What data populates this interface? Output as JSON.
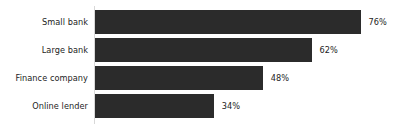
{
  "chart_data": {
    "type": "bar",
    "orientation": "horizontal",
    "title": "",
    "subtitle": "",
    "xlabel": "",
    "ylabel": "",
    "categories": [
      "Small bank",
      "Large bank",
      "Finance company",
      "Online lender"
    ],
    "values": [
      76,
      62,
      48,
      34
    ],
    "value_labels": [
      "76%",
      "62%",
      "48%",
      "34%"
    ],
    "unit": "%",
    "xlim": [
      0,
      87
    ],
    "grid": false,
    "legend": false,
    "legend_position": "none",
    "series": [
      {
        "name": "Approval rate",
        "values": [
          76,
          62,
          48,
          34
        ]
      }
    ],
    "bar_color": "#2b2b2b",
    "background_color": "#ffffff",
    "axis_line_color": "#d8d8d8",
    "label_color": "#1d1d1d"
  },
  "rows": [
    {
      "label": "Small bank",
      "value": 76,
      "value_label": "76%"
    },
    {
      "label": "Large bank",
      "value": 62,
      "value_label": "62%"
    },
    {
      "label": "Finance company",
      "value": 48,
      "value_label": "48%"
    },
    {
      "label": "Online lender",
      "value": 34,
      "value_label": "34%"
    }
  ]
}
